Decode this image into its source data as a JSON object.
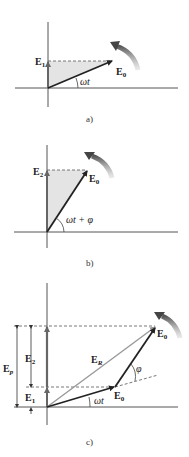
{
  "figure": {
    "panels": [
      {
        "id": "a",
        "caption": "a)",
        "labels": {
          "e_vertical": "E",
          "e_vertical_sub": "1",
          "e_rot": "E",
          "e_rot_sub": "0",
          "angle": "ωt"
        }
      },
      {
        "id": "b",
        "caption": "b)",
        "labels": {
          "e_vertical": "E",
          "e_vertical_sub": "2",
          "e_rot": "E",
          "e_rot_sub": "0",
          "angle": "ωt + φ"
        }
      },
      {
        "id": "c",
        "caption": "c)",
        "labels": {
          "ep": "E",
          "ep_sub": "p",
          "e2": "E",
          "e2_sub": "2",
          "e1": "E",
          "e1_sub": "1",
          "er": "E",
          "er_sub": "R",
          "e0_first": "E",
          "e0_first_sub": "0",
          "e0_second": "E",
          "e0_second_sub": "0",
          "angle_wt": "ωt",
          "angle_phi": "φ"
        }
      }
    ],
    "colors": {
      "axis": "#555555",
      "vector_dark": "#222222",
      "vector_gray": "#666666",
      "resultant": "#999999",
      "shade": "#e4e4e4",
      "rotation_arrow": "#777777"
    }
  }
}
